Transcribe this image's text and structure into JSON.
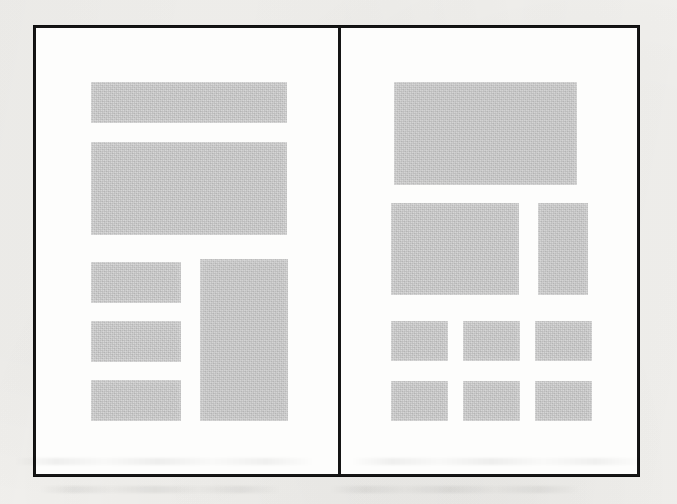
{
  "document": {
    "kind": "scanned-page-layout-diagram",
    "title": "Two-page layout wireframe",
    "page_background_color": "#f3f2ef",
    "paper_color": "#fdfdfc",
    "border_color": "#151515",
    "block_color": "#c9c9c9",
    "border_width_px": 3
  },
  "figure": {
    "frame": {
      "x": 33,
      "y": 25,
      "width": 607,
      "height": 452
    },
    "divider": {
      "x": 302,
      "width": 3
    },
    "panels": [
      {
        "name": "left-page-layout",
        "label": "Left page layout",
        "blocks": [
          {
            "name": "header-banner",
            "x": 55,
            "y": 54,
            "w": 196,
            "h": 41
          },
          {
            "name": "hero-content-block",
            "x": 55,
            "y": 114,
            "w": 196,
            "h": 93
          },
          {
            "name": "text-column-row-1",
            "x": 55,
            "y": 234,
            "w": 90,
            "h": 41
          },
          {
            "name": "text-column-row-2",
            "x": 55,
            "y": 293,
            "w": 90,
            "h": 41
          },
          {
            "name": "text-column-row-3",
            "x": 55,
            "y": 352,
            "w": 90,
            "h": 41
          },
          {
            "name": "sidebar-tall-block",
            "x": 164,
            "y": 231,
            "w": 88,
            "h": 162
          }
        ]
      },
      {
        "name": "right-page-layout",
        "label": "Right page layout",
        "blocks": [
          {
            "name": "hero-banner",
            "x": 53,
            "y": 54,
            "w": 183,
            "h": 103
          },
          {
            "name": "feature-main-block",
            "x": 50,
            "y": 175,
            "w": 128,
            "h": 92
          },
          {
            "name": "feature-side-block",
            "x": 197,
            "y": 175,
            "w": 50,
            "h": 92
          },
          {
            "name": "grid-cell-r1c1",
            "x": 50,
            "y": 293,
            "w": 57,
            "h": 40
          },
          {
            "name": "grid-cell-r1c2",
            "x": 122,
            "y": 293,
            "w": 57,
            "h": 40
          },
          {
            "name": "grid-cell-r1c3",
            "x": 194,
            "y": 293,
            "w": 57,
            "h": 40
          },
          {
            "name": "grid-cell-r2c1",
            "x": 50,
            "y": 353,
            "w": 57,
            "h": 40
          },
          {
            "name": "grid-cell-r2c2",
            "x": 122,
            "y": 353,
            "w": 57,
            "h": 40
          },
          {
            "name": "grid-cell-r2c3",
            "x": 194,
            "y": 353,
            "w": 57,
            "h": 40
          }
        ]
      }
    ]
  },
  "ghost_text": {
    "note": "Faint bleed-through / offset printing artifacts below the figure; characters are illegible in the scan.",
    "lines": [
      {
        "text": "",
        "x": 14,
        "y": 18,
        "size": 13,
        "strip": true,
        "w": 300
      },
      {
        "text": "",
        "x": 352,
        "y": 18,
        "size": 13,
        "strip": true,
        "w": 290
      },
      {
        "text": "",
        "x": 40,
        "y": 46,
        "size": 12,
        "strip": true,
        "w": 240
      },
      {
        "text": "",
        "x": 330,
        "y": 46,
        "size": 12,
        "strip": true,
        "w": 250
      }
    ]
  }
}
